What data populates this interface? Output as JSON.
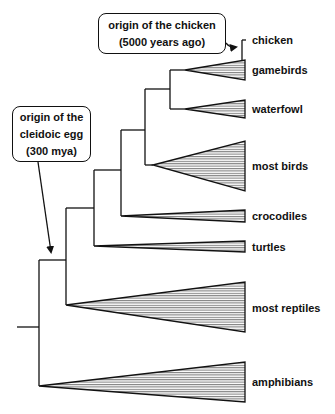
{
  "diagram": {
    "type": "phylogenetic-tree",
    "callouts": {
      "chicken": {
        "lines": [
          "origin of the chicken",
          "(5000 years ago)"
        ]
      },
      "egg": {
        "lines": [
          "origin of the",
          "cleidoic egg",
          "(300 mya)"
        ]
      }
    },
    "taxa": [
      {
        "id": "chicken",
        "label": "chicken"
      },
      {
        "id": "gamebirds",
        "label": "gamebirds"
      },
      {
        "id": "waterfowl",
        "label": "waterfowl"
      },
      {
        "id": "most_birds",
        "label": "most birds"
      },
      {
        "id": "crocodiles",
        "label": "crocodiles"
      },
      {
        "id": "turtles",
        "label": "turtles"
      },
      {
        "id": "most_reptiles",
        "label": "most reptiles"
      },
      {
        "id": "amphibians",
        "label": "amphibians"
      }
    ],
    "colors": {
      "line": "#111111",
      "background": "#ffffff"
    }
  }
}
